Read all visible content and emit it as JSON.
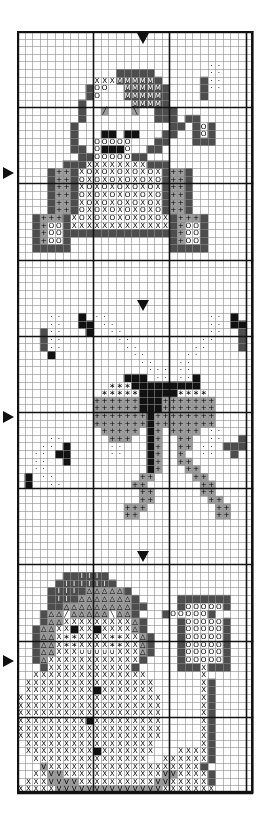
{
  "document": {
    "title": "Cross Stitch Pattern Chart",
    "type": "counted-cross-stitch-chart",
    "background_color": "#ffffff",
    "ink_color": "#111111"
  },
  "grid": {
    "columns": 31,
    "rows": 100,
    "cell_size_px": 7.62,
    "origin_x_px": 17,
    "origin_y_px": 31,
    "width_px": 241,
    "height_px": 779,
    "minor_line_color": "#8a8a8a",
    "major_line_color": "#111111",
    "border_color": "#111111",
    "major_every": 10,
    "minor_line_width": 0.6,
    "major_line_width": 1.6,
    "border_line_width": 2.4
  },
  "markers": [
    {
      "name": "center-marker-top",
      "direction": "down",
      "col": 16,
      "row": 0,
      "label": "▼"
    },
    {
      "name": "center-marker-bear",
      "direction": "right",
      "col": 0,
      "row": 18,
      "label": "▶"
    },
    {
      "name": "center-marker-bow-top",
      "direction": "down",
      "col": 16,
      "row": 35,
      "label": "▼"
    },
    {
      "name": "center-marker-bow",
      "direction": "right",
      "col": 0,
      "row": 50,
      "label": "▶"
    },
    {
      "name": "center-marker-snowman-top",
      "direction": "down",
      "col": 16,
      "row": 68,
      "label": "▼"
    },
    {
      "name": "center-marker-snowman",
      "direction": "right",
      "col": 0,
      "row": 82,
      "label": "▶"
    }
  ],
  "symbol_legend": [
    {
      "key": "blank",
      "glyph": "",
      "fill": "#ffffff",
      "ink": "#000000",
      "description": "unstitched background"
    },
    {
      "key": "X",
      "glyph": "X",
      "fill": "#ffffff",
      "ink": "#000000",
      "description": "cross on white"
    },
    {
      "key": "Xd",
      "glyph": "X",
      "fill": "#4d4d4d",
      "ink": "#ffffff",
      "description": "cross on dark"
    },
    {
      "key": "O",
      "glyph": "O",
      "fill": "#ffffff",
      "ink": "#000000",
      "description": "circle on white"
    },
    {
      "key": "Og",
      "glyph": "O",
      "fill": "#9c9c9c",
      "ink": "#000000",
      "description": "circle on grey"
    },
    {
      "key": "Od",
      "glyph": "O",
      "fill": "#4d4d4d",
      "ink": "#ffffff",
      "description": "circle on dark"
    },
    {
      "key": "P",
      "glyph": "+",
      "fill": "#9c9c9c",
      "ink": "#000000",
      "description": "plus on grey"
    },
    {
      "key": "Pw",
      "glyph": "+",
      "fill": "#ffffff",
      "ink": "#000000",
      "description": "plus on white"
    },
    {
      "key": "V",
      "glyph": "V",
      "fill": "#9c9c9c",
      "ink": "#000000",
      "description": "vee on grey"
    },
    {
      "key": "Vd",
      "glyph": "V",
      "fill": "#4d4d4d",
      "ink": "#ffffff",
      "description": "vee on dark"
    },
    {
      "key": "M",
      "glyph": "M",
      "fill": "#4d4d4d",
      "ink": "#ffffff",
      "description": "em on dark"
    },
    {
      "key": "T",
      "glyph": "△",
      "fill": "#9c9c9c",
      "ink": "#000000",
      "description": "triangle on grey"
    },
    {
      "key": "Td",
      "glyph": "△",
      "fill": "#4d4d4d",
      "ink": "#ffffff",
      "description": "triangle on dark"
    },
    {
      "key": "B",
      "glyph": "",
      "fill": "#111111",
      "ink": "#ffffff",
      "description": "solid black block"
    },
    {
      "key": "D",
      "glyph": "·",
      "fill": "#ffffff",
      "ink": "#000000",
      "description": "dot on white"
    },
    {
      "key": "G",
      "glyph": "",
      "fill": "#9c9c9c",
      "ink": "#000000",
      "description": "plain grey block"
    },
    {
      "key": "K",
      "glyph": "",
      "fill": "#4d4d4d",
      "ink": "#ffffff",
      "description": "plain dark block"
    },
    {
      "key": "S",
      "glyph": "∗",
      "fill": "#ffffff",
      "ink": "#000000",
      "description": "star on white"
    },
    {
      "key": "Sg",
      "glyph": "∗",
      "fill": "#9c9c9c",
      "ink": "#000000",
      "description": "star on grey"
    },
    {
      "key": "L",
      "glyph": "╱",
      "fill": "#9c9c9c",
      "ink": "#000000",
      "description": "backstitch slash"
    },
    {
      "key": "R",
      "glyph": "╲",
      "fill": "#9c9c9c",
      "ink": "#000000",
      "description": "backstitch slash reverse"
    },
    {
      "key": "Lw",
      "glyph": "╱",
      "fill": "#ffffff",
      "ink": "#000000",
      "description": "backstitch slash on white"
    },
    {
      "key": "Rw",
      "glyph": "╲",
      "fill": "#ffffff",
      "ink": "#000000",
      "description": "backstitch slash reverse on white"
    },
    {
      "key": "U",
      "glyph": "∪",
      "fill": "#ffffff",
      "ink": "#000000",
      "description": "smile arc"
    },
    {
      "key": "I",
      "glyph": "I",
      "fill": "#4d4d4d",
      "ink": "#ffffff",
      "description": "eye-bar on dark"
    }
  ],
  "motifs": [
    {
      "name": "teddy-bear",
      "title": "Teddy Bear",
      "row_start": 4,
      "row_end": 32
    },
    {
      "name": "ribbon-bow",
      "title": "Ribbon Bow",
      "row_start": 37,
      "row_end": 66
    },
    {
      "name": "snowman",
      "title": "Snowman",
      "row_start": 70,
      "row_end": 99
    }
  ],
  "chart_data": {
    "type": "heatmap",
    "title": "Cross Stitch Pattern Chart",
    "xlabel": "",
    "ylabel": "",
    "grid": true,
    "legend_position": "none",
    "columns": 31,
    "rows": 100,
    "cells": [
      "...............................",
      "...............................",
      "...............................",
      "...............................",
      ".........................DD....",
      ".............KKKKK.......DD....",
      "..........XXXMMMMMK.....KDD....",
      ".........KOO..MMMMMK....KDD....",
      ".........KO..+MMMMMK....K......",
      "........K.+++++MMMMK..........",
      "........K++L+++R++KKK..........",
      "........K+++++++++KKK.KK.......",
      ".......K++++++++++++KK.KOK.....",
      ".......K+++BB+BB+++KK..KOK.....",
      ".......K++OOOOO+++KK...KKK.....",
      ".......KK+OBBBO++KK............",
      "........KKOOOOOKK..............",
      "......KKKXXXXXXXXKKK...........",
      "....KPPKXOXOXOXOXOXKPPK........",
      "....KPPKOXOXOXOXOXOKPPK........",
      "....KPPKXOXOXOXOXOXKPPK........",
      "....KPPKOXOXOXOXOXOKPPK........",
      "....KPPKXOXOXOXOXOXKPPK........",
      "....KPPKOXOXOXOXOXOKPPK........",
      "..KPPPKXOXOXOXOXOXOXKPPPK......",
      "..KPOOKXXXXXXXXXXXXXKPOOK......",
      "..KPOOKKKKKKKKKKKKKKKPOOK......",
      "..KPOOK.............KPOOK......",
      "..KKKKK.............KKKKK......",
      "...............................",
      "...............................",
      "...............................",
      "...............................",
      "...............................",
      "...............................",
      "...............................",
      "...............................",
      "....DD..B.DD.............DD.B..",
      "....DD..BB.DD............DD.BB.",
      "...KDD...B..DD...........DD..K.",
      "...KDD.......DD.........DD...K.",
      "...KDD........DD.......DD....K.",
      "....B..........DD.....DD.......",
      "................DD...DD........",
      ".................DDD.DD........",
      "..............BBB.DD.DDB.......",
      "............SSSBBBBBBBBB.......",
      "...........SSSSSBBBBBSSSS......",
      "..........PPPPPPBBBPPPPPPP.....",
      "..........PPPPPPBBBPPPPPPP.....",
      "..........PPPPPPPBPPPPPPPP.....",
      "..........PPPPPPPBPPPPPPPP.....",
      "...........PPPPP.BP.PPPP.DD....",
      "....DD......PPP..BP..PP..DD..K.",
      "...DD.B.....DD...BP..PP.DD.KKK.",
      "..DD.BB.....DD...BP..P..DD..K..",
      "..DD..B..........BP..PP........",
      "..DD.............BP...PP.......",
      ".B.DD...........PP.....PP......",
      ".B..DD.........PP.......PP.....",
      "................PP......PP.....",
      "................PP.......PP....",
      "..............PPP.........PP...",
      "..............PP..........PP...",
      "...............................",
      "...............................",
      "...............................",
      "...............................",
      "...............................",
      "...............................",
      "...............................",
      "......KKIIIK...................",
      ".....KIIIIIIK..................",
      "....KIIIKTTTTTK................",
      "....KIIKTTTTTTTK.....KKKKKKK...",
      "....KKTTTTTTTTTKK....KOOOOOK...",
      "...KTTLwTTTTTRwTTK...KOOOOOK...",
      "...KTTXXXXXXXXXTK....KOOOOOK...",
      "..KTTXXBXXBXXXXTK....KOOOOOK...",
      "..KTTXSSXXXXSSXXTK...KOOOOOK...",
      "..KTTXSSXXXXSSXXTK...KOOOOOK...",
      "..KTTXXXUUUUUXXXTK...KOOOOOK...",
      "..KTXXXXXXXXXXXXK....KOOOOOK...",
      "...KXXXXXXXXXXXK.....KKKXKKK...",
      "..XXXXXXXXXXXXXXX.......X......",
      ".XXXXXXXXXXXXXXXXX......XK.....",
      ".XXXXXXXXXBXXXXXXX......XK.....",
      "XXXXXXXXXXXXXXXXXXX.....XK.....",
      "XXXXXXXXXXXXXXXXXXX.....XK.....",
      "XXXXXXXXXXXXXXXXXXX.....XK.....",
      "XXXXXXXXXBXXXXXXXXX.....XK.....",
      "XXXXXXXXXXXXXXXXXXX.....XK.....",
      "XXXXXXXXXXXXXXXXXXX.....XK.....",
      ".XXXXXXXXXXXXXXXXX......XK.....",
      ".XXXXXXXXXBXXXXXXX...XXXXK.....",
      "..XXXXXXXXXXXXXXX..XXXXXXK.....",
      "...VXXXXXXXXXXXXXXXXXXXXK......",
      "..XXVVXXXXXXXXXXXXXVVXXXXK.....",
      ".XXXVVVVXXXXXXXXXXVVXXXXXK.....",
      "XXXXXVVVVVVVVVVVVVVXXXXXXX.....",
      "...XXOXX.......XXOXXOXX........",
      "..............................."
    ]
  }
}
